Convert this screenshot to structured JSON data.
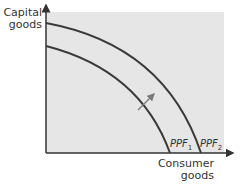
{
  "diagram": {
    "type": "production-possibility-frontier",
    "y_axis": {
      "line1": "Capital",
      "line2": "goods"
    },
    "x_axis": {
      "line1": "Consumer",
      "line2": "goods"
    },
    "curves": [
      {
        "name": "PPF",
        "subscript": "1"
      },
      {
        "name": "PPF",
        "subscript": "2"
      }
    ],
    "annotation": "outward-shift-arrow",
    "colors": {
      "panel": "#e6e6e6",
      "curve": "#3a3a3a",
      "arrow": "#7a7a7a",
      "axis": "#333333"
    }
  }
}
